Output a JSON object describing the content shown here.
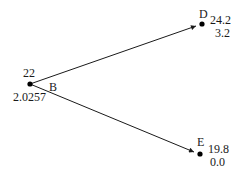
{
  "diagram": {
    "type": "binomial-tree",
    "nodes": [
      {
        "id": "B",
        "label": "B",
        "top_value": "22",
        "bottom_value": "2.0257"
      },
      {
        "id": "D",
        "label": "D",
        "top_value": "24.2",
        "bottom_value": "3.2"
      },
      {
        "id": "E",
        "label": "E",
        "top_value": "19.8",
        "bottom_value": "0.0"
      }
    ],
    "edges": [
      {
        "from": "B",
        "to": "D"
      },
      {
        "from": "B",
        "to": "E"
      }
    ],
    "colors": {
      "line": "#1a1a1a",
      "node": "#000000",
      "background": "#ffffff"
    }
  }
}
